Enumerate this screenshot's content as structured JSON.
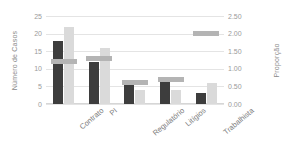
{
  "chart_data": {
    "type": "bar",
    "title": "",
    "xlabel": "",
    "ylabel": "Número de Casos",
    "y2label": "Proporção",
    "categories": [
      "Contrato",
      "PI",
      "Regulatório",
      "Litígios",
      "Trabalhista"
    ],
    "series": [
      {
        "name": "Casos (escuro)",
        "axis": "left",
        "render": "bar",
        "color": "#3d3d3d",
        "values": [
          18,
          12,
          6,
          7,
          3
        ]
      },
      {
        "name": "Casos (claro)",
        "axis": "left",
        "render": "bar",
        "color": "#dadada",
        "values": [
          22,
          16,
          4,
          4,
          6
        ]
      },
      {
        "name": "Proporção",
        "axis": "right",
        "render": "marker",
        "color": "#b4b4b4",
        "values": [
          1.2,
          1.3,
          0.6,
          0.7,
          2.0
        ]
      }
    ],
    "ylim": [
      0,
      25
    ],
    "y2lim": [
      0.0,
      2.5
    ],
    "yticks": [
      0,
      5,
      10,
      15,
      20,
      25
    ],
    "y2ticks": [
      "0.00",
      "0.50",
      "1.00",
      "1.50",
      "2.00",
      "2.50"
    ],
    "grid": true,
    "legend": false,
    "background": "#ffffff"
  },
  "axes": {
    "left": {
      "title": "Número de Casos",
      "tick_labels": [
        "25",
        "20",
        "15",
        "10",
        "5",
        "0"
      ]
    },
    "right": {
      "title": "Proporção",
      "tick_labels": [
        "2.50",
        "2.00",
        "1.50",
        "1.00",
        "0.50",
        "0.00"
      ]
    }
  },
  "categories": [
    {
      "label": "Contrato"
    },
    {
      "label": "PI"
    },
    {
      "label": "Regulatório"
    },
    {
      "label": "Litígios"
    },
    {
      "label": "Trabalhista"
    }
  ],
  "colors": {
    "bar_dark": "#3d3d3d",
    "bar_light": "#dadada",
    "marker": "#b4b4b4",
    "gridline": "#e4e4e4",
    "text": "#8a8a8a",
    "background": "#ffffff"
  }
}
